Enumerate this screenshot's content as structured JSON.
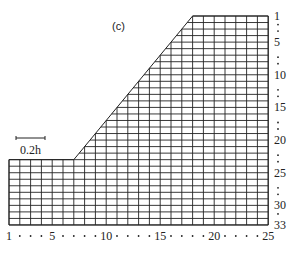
{
  "figure": {
    "panel_label": "(c)",
    "scale_bar_label": "0.2h",
    "grid": {
      "columns": 25,
      "rows": 33,
      "x0": 9,
      "col_pitch": 10.8,
      "y0": 16,
      "row_pitch": 6.53,
      "crest_start_col": 18,
      "toe_col": 7,
      "toe_row": 23
    },
    "x_axis": {
      "labels": [
        {
          "text": "1",
          "col": 1
        },
        {
          "text": "5",
          "col": 5
        },
        {
          "text": "10",
          "col": 10
        },
        {
          "text": "15",
          "col": 15
        },
        {
          "text": "20",
          "col": 20
        },
        {
          "text": "25",
          "col": 25
        }
      ],
      "dot_cols": [
        2,
        3,
        4,
        6,
        7,
        8,
        9,
        11,
        12,
        13,
        14,
        16,
        17,
        18,
        19,
        21,
        22,
        23,
        24
      ]
    },
    "y_axis": {
      "labels": [
        {
          "text": "1",
          "row": 1
        },
        {
          "text": "5",
          "row": 5
        },
        {
          "text": "10",
          "row": 10
        },
        {
          "text": "15",
          "row": 15
        },
        {
          "text": "20",
          "row": 20
        },
        {
          "text": "25",
          "row": 25
        },
        {
          "text": "30",
          "row": 30
        },
        {
          "text": "33",
          "row": 33
        }
      ],
      "dot_rows": [
        2,
        3,
        7,
        8,
        12,
        13,
        17,
        18,
        22,
        23,
        27,
        28,
        31
      ]
    },
    "colors": {
      "line": "#222222",
      "background": "#ffffff"
    }
  }
}
